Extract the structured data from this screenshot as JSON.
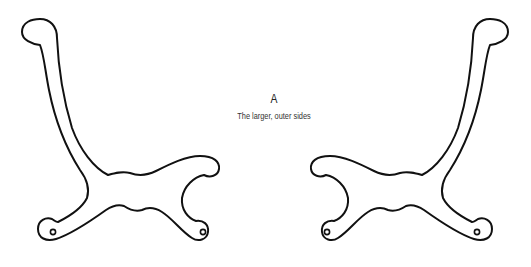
{
  "figure": {
    "label": "A",
    "caption": "The larger, outer sides",
    "stroke_color": "#111111",
    "background_color": "#ffffff"
  },
  "pieces": [
    {
      "name": "left-side-piece",
      "orientation": "original",
      "holes": 2
    },
    {
      "name": "right-side-piece",
      "orientation": "mirrored",
      "holes": 2
    }
  ]
}
